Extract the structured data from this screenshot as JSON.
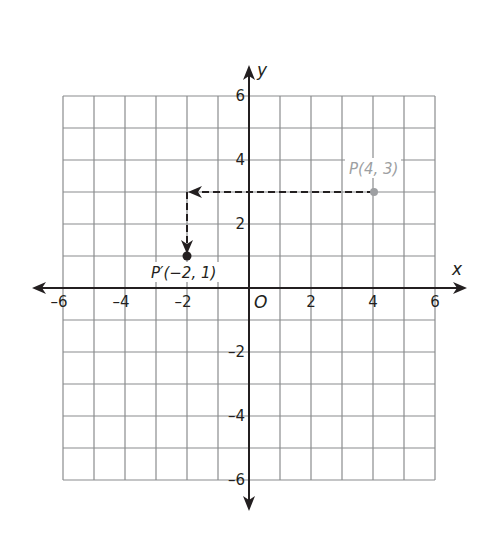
{
  "diagram": {
    "type": "coordinate-plane-translation",
    "axes": {
      "x_label": "x",
      "y_label": "y",
      "origin_label": "O",
      "x_range": [
        -6,
        6
      ],
      "y_range": [
        -6,
        6
      ],
      "grid_step": 1,
      "x_tick_labels": [
        "-6",
        "-4",
        "-2",
        "2",
        "4",
        "6"
      ],
      "y_tick_labels": [
        "6",
        "4",
        "2",
        "-2",
        "-4",
        "-6"
      ]
    },
    "points": [
      {
        "name": "P",
        "label": "P(4, 3)",
        "x": 4,
        "y": 3,
        "color": "#9d9fa2"
      },
      {
        "name": "P-prime",
        "label": "P′(−2, 1)",
        "x": -2,
        "y": 1,
        "color": "#231f20"
      }
    ],
    "translation_path": [
      {
        "from": [
          4,
          3
        ],
        "to": [
          -2,
          3
        ],
        "style": "dashed",
        "arrow": "end"
      },
      {
        "from": [
          -2,
          3
        ],
        "to": [
          -2,
          1
        ],
        "style": "dashed",
        "arrow": "end"
      }
    ],
    "colors": {
      "grid": "#8a8c8e",
      "axis": "#231f20",
      "original_point": "#9d9fa2",
      "image_point": "#231f20"
    }
  }
}
